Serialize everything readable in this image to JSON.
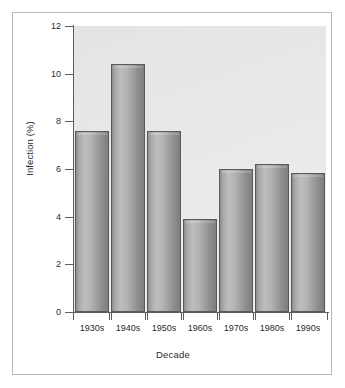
{
  "chart_data": {
    "type": "bar",
    "title": "",
    "xlabel": "Decade",
    "ylabel": "Infection (%)",
    "categories": [
      "1930s",
      "1940s",
      "1950s",
      "1960s",
      "1970s",
      "1980s",
      "1990s"
    ],
    "values": [
      7.6,
      10.4,
      7.6,
      3.9,
      6.0,
      6.2,
      5.85
    ],
    "ylim": [
      0,
      12
    ],
    "yticks": [
      0,
      2,
      4,
      6,
      8,
      10,
      12
    ],
    "ytick_labels": [
      "0",
      "2",
      "4",
      "6",
      "8",
      "10",
      "12"
    ],
    "grid": false,
    "legend": "none",
    "bar_style": "cylindrical-gradient-gray",
    "plot_background_color": "#e9e9e9",
    "bar_fill_color": "#aaaaaa",
    "bar_edge_color": "#5a5a5a",
    "axis_color": "#5d5d5d",
    "text_color": "#2b2b2b",
    "figure_background_color": "#ffffff",
    "figure_border_color": "#b8b8b8"
  }
}
